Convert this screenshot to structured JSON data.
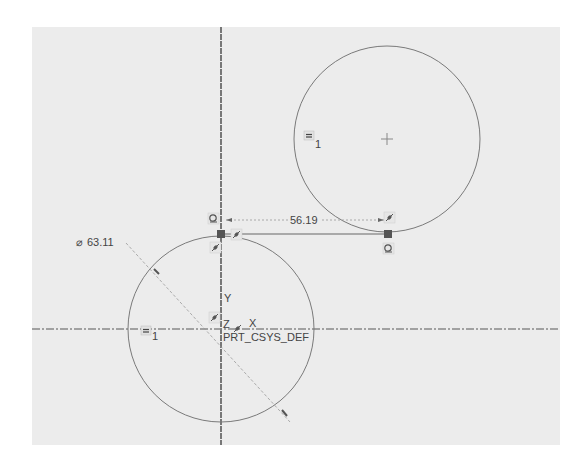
{
  "sketch": {
    "background_color": "#ececec",
    "line_color": "#6e6e6e",
    "axis_color": "#7a7a7a",
    "coordinate_system": {
      "name": "PRT_CSYS_DEF",
      "x_label": "X",
      "y_label": "Y",
      "z_label": "Z"
    },
    "circles": [
      {
        "id": "circle-left",
        "center": [
          221,
          330
        ],
        "radius": 93,
        "equal_constraint_label": "1"
      },
      {
        "id": "circle-right",
        "center": [
          387,
          139
        ],
        "radius": 93,
        "equal_constraint_label": "1"
      }
    ],
    "dimensions": {
      "diameter": {
        "symbol": "⌀",
        "value": "63.11"
      },
      "distance": {
        "value": "56.19"
      }
    },
    "tangent_line": {
      "from": [
        221,
        235
      ],
      "to": [
        388,
        235
      ]
    },
    "constraint_icons": [
      "tangent-icon",
      "point-on-entity-icon",
      "equal-radius-icon"
    ]
  }
}
